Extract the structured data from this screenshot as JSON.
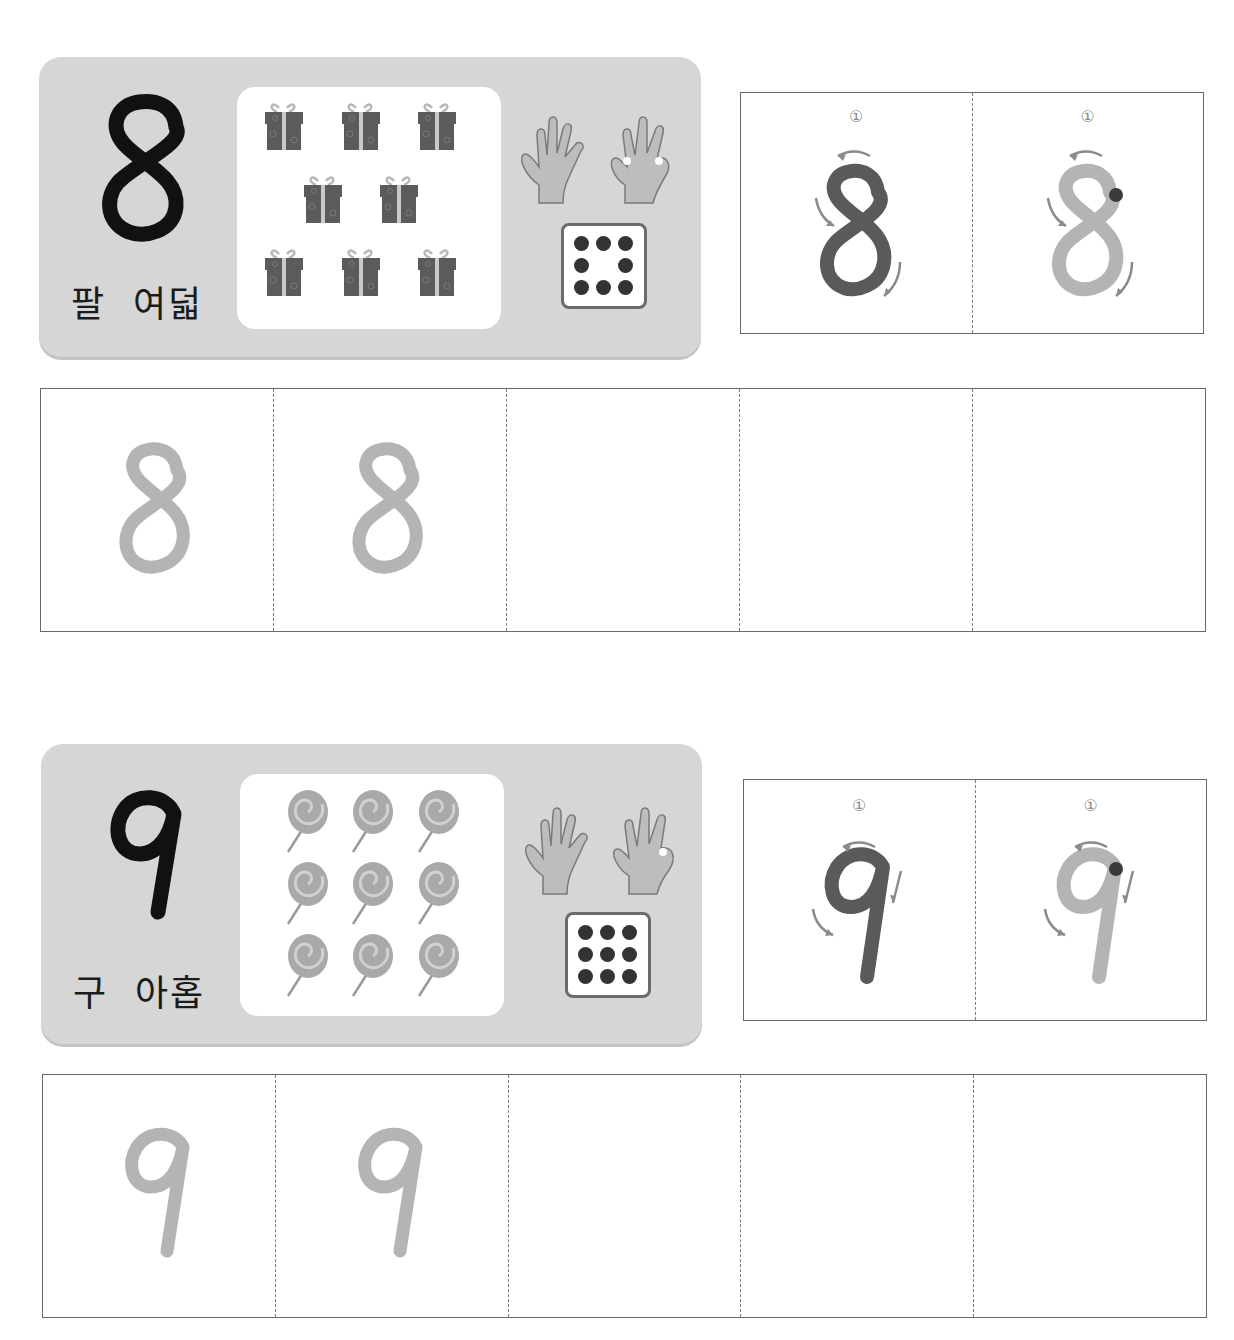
{
  "sections": [
    {
      "number": "8",
      "words": "팔  여덟",
      "word_sino": "팔",
      "word_native": "여덟",
      "picture": {
        "object": "gift-box",
        "count": 8,
        "rows": [
          3,
          2,
          3
        ]
      },
      "hands": {
        "left_fingers": 5,
        "right_fingers": 3
      },
      "dice_pips": 8,
      "stroke_guide": {
        "step_label": "①",
        "cells": [
          "model-dark",
          "trace-start-dot"
        ]
      },
      "practice_row": {
        "cells": [
          "8",
          "8",
          "",
          "",
          ""
        ]
      }
    },
    {
      "number": "9",
      "words": "구  아홉",
      "word_sino": "구",
      "word_native": "아홉",
      "picture": {
        "object": "lollipop",
        "count": 9,
        "rows": [
          3,
          3,
          3
        ]
      },
      "hands": {
        "left_fingers": 5,
        "right_fingers": 4
      },
      "dice_pips": 9,
      "stroke_guide": {
        "step_label": "①",
        "cells": [
          "model-dark",
          "trace-start-dot"
        ]
      },
      "practice_row": {
        "cells": [
          "9",
          "9",
          "",
          "",
          ""
        ]
      }
    }
  ],
  "colors": {
    "card_bg": "#d6d6d6",
    "digit_black": "#111111",
    "model_dark": "#5a5a5a",
    "trace_light": "#b4b4b4",
    "arrow": "#8a8a8a",
    "start_dot": "#3a3a3a",
    "border": "#6a6a6a"
  }
}
